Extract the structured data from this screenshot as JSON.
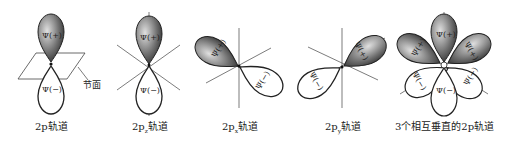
{
  "panels": [
    {
      "caption": "2p轨道",
      "caption_sub": "",
      "node_label": "节面"
    },
    {
      "caption_pre": "2p",
      "caption_sub": "z",
      "caption_post": "轨道"
    },
    {
      "caption_pre": "2p",
      "caption_sub": "x",
      "caption_post": "轨道"
    },
    {
      "caption_pre": "2p",
      "caption_sub": "y",
      "caption_post": "轨道"
    },
    {
      "caption": "3个相互垂直的2p轨道"
    }
  ],
  "lobe_labels": {
    "positive": "Ψ(+)",
    "negative": "Ψ(−)"
  },
  "colors": {
    "positive_fill_dark": "#3a3a3a",
    "positive_fill_light": "#d8d8d8",
    "negative_fill": "#ffffff",
    "line": "#444444"
  }
}
